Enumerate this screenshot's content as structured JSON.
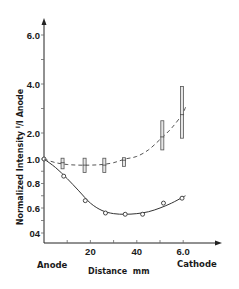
{
  "chart_data": {
    "type": "line",
    "title": "",
    "xlabel": "Distance  mm",
    "ylabel": "Normalized Intensity I/I Anode",
    "ylabel_parts": {
      "main": "Normalized Intensity ",
      "sup": "I",
      "slash": "/",
      "sub": "I",
      "tail": " Anode"
    },
    "x_end_labels": {
      "left": "Anode",
      "right": "Cathode"
    },
    "xlim": [
      0,
      65
    ],
    "ylim": [
      0.3,
      6.5
    ],
    "y_scale": "broken (0.4–1.0 fine, 1.0–6.0 coarse)",
    "x_ticks": [
      {
        "value": 10,
        "label": ""
      },
      {
        "value": 20,
        "label": "20"
      },
      {
        "value": 30,
        "label": ""
      },
      {
        "value": 40,
        "label": "40"
      },
      {
        "value": 50,
        "label": ""
      },
      {
        "value": 60,
        "label": "6.0"
      }
    ],
    "y_ticks": [
      {
        "value": 0.4,
        "label": "04"
      },
      {
        "value": 0.5,
        "label": ""
      },
      {
        "value": 0.6,
        "label": "0.6"
      },
      {
        "value": 0.7,
        "label": ""
      },
      {
        "value": 0.8,
        "label": "0.8"
      },
      {
        "value": 0.9,
        "label": ""
      },
      {
        "value": 1.0,
        "label": "1.0"
      },
      {
        "value": 2.0,
        "label": "2.0"
      },
      {
        "value": 3.0,
        "label": ""
      },
      {
        "value": 4.0,
        "label": "4.0"
      },
      {
        "value": 5.0,
        "label": ""
      },
      {
        "value": 6.0,
        "label": "6.0"
      }
    ],
    "grid": false,
    "series": [
      {
        "name": "solid-circles",
        "style": "solid",
        "marker": "open-circle",
        "points": [
          {
            "x": 0,
            "y": 1.0
          },
          {
            "x": 8.5,
            "y": 0.86
          },
          {
            "x": 17.8,
            "y": 0.66
          },
          {
            "x": 26.5,
            "y": 0.56
          },
          {
            "x": 35,
            "y": 0.55
          },
          {
            "x": 42.5,
            "y": 0.55
          },
          {
            "x": 51.5,
            "y": 0.64
          },
          {
            "x": 59.5,
            "y": 0.68
          }
        ],
        "curve": [
          {
            "x": 0,
            "y": 1.0
          },
          {
            "x": 5,
            "y": 0.93
          },
          {
            "x": 10,
            "y": 0.84
          },
          {
            "x": 15,
            "y": 0.74
          },
          {
            "x": 20,
            "y": 0.64
          },
          {
            "x": 25,
            "y": 0.58
          },
          {
            "x": 30,
            "y": 0.555
          },
          {
            "x": 35,
            "y": 0.55
          },
          {
            "x": 40,
            "y": 0.555
          },
          {
            "x": 45,
            "y": 0.57
          },
          {
            "x": 50,
            "y": 0.6
          },
          {
            "x": 55,
            "y": 0.64
          },
          {
            "x": 60,
            "y": 0.69
          },
          {
            "x": 61,
            "y": 0.7
          }
        ]
      },
      {
        "name": "dashed-errorbars",
        "style": "dashed",
        "marker": "error-bar",
        "points": [
          {
            "x": 8,
            "y": 0.97,
            "ylow": 0.92,
            "yhigh": 1.03
          },
          {
            "x": 17.5,
            "y": 0.95,
            "ylow": 0.89,
            "yhigh": 1.03
          },
          {
            "x": 26,
            "y": 0.95,
            "ylow": 0.89,
            "yhigh": 1.03
          },
          {
            "x": 34.5,
            "y": 0.99,
            "ylow": 0.94,
            "yhigh": 1.05
          },
          {
            "x": 51,
            "y": 1.85,
            "ylow": 1.35,
            "yhigh": 2.5
          },
          {
            "x": 59.5,
            "y": 2.75,
            "ylow": 1.8,
            "yhigh": 3.9
          }
        ],
        "curve": [
          {
            "x": 0,
            "y": 1.0
          },
          {
            "x": 5,
            "y": 0.97
          },
          {
            "x": 10,
            "y": 0.955
          },
          {
            "x": 15,
            "y": 0.95
          },
          {
            "x": 20,
            "y": 0.95
          },
          {
            "x": 25,
            "y": 0.955
          },
          {
            "x": 30,
            "y": 0.97
          },
          {
            "x": 35,
            "y": 1.0
          },
          {
            "x": 40,
            "y": 1.1
          },
          {
            "x": 45,
            "y": 1.35
          },
          {
            "x": 50,
            "y": 1.75
          },
          {
            "x": 55,
            "y": 2.2
          },
          {
            "x": 59.5,
            "y": 2.75
          },
          {
            "x": 61,
            "y": 3.05
          }
        ]
      }
    ]
  }
}
